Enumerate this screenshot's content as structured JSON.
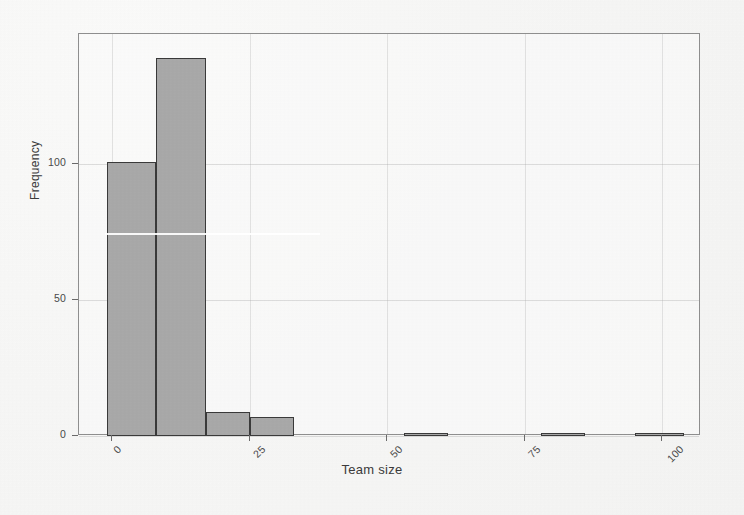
{
  "chart_data": {
    "type": "bar",
    "title": "",
    "subtitle": "",
    "xlabel": "Team size",
    "ylabel": "Frequency",
    "xlim": [
      -6,
      107
    ],
    "ylim": [
      0,
      148
    ],
    "grid": true,
    "legend": null,
    "bin_width": 8,
    "bar_fill_color": "#a9a9a9",
    "bar_edge_color": "#3a3a3a",
    "x_ticks": [
      {
        "value": 0,
        "label": "0"
      },
      {
        "value": 25,
        "label": "25"
      },
      {
        "value": 50,
        "label": "50"
      },
      {
        "value": 75,
        "label": "75"
      },
      {
        "value": 100,
        "label": "100"
      }
    ],
    "y_ticks": [
      {
        "value": 0,
        "label": "0"
      },
      {
        "value": 50,
        "label": "50"
      },
      {
        "value": 100,
        "label": "100"
      }
    ],
    "x_tick_rotation": -45,
    "bins": [
      {
        "x0": -1,
        "x1": 8,
        "value": 101
      },
      {
        "x0": 8,
        "x1": 17,
        "value": 139
      },
      {
        "x0": 17,
        "x1": 25,
        "value": 9
      },
      {
        "x0": 25,
        "x1": 33,
        "value": 7
      },
      {
        "x0": 53,
        "x1": 61,
        "value": 1
      },
      {
        "x0": 78,
        "x1": 86,
        "value": 1
      },
      {
        "x0": 95,
        "x1": 104,
        "value": 1
      }
    ],
    "categories": [
      "-1–8",
      "8–17",
      "17–25",
      "25–33",
      "53–61",
      "78–86",
      "95–104"
    ],
    "values": [
      101,
      139,
      9,
      7,
      1,
      1,
      1
    ]
  }
}
